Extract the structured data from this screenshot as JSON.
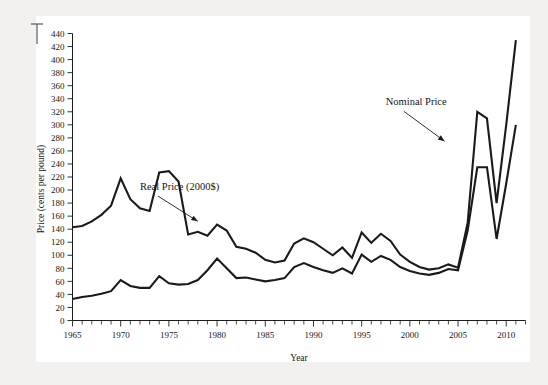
{
  "chart_data": {
    "type": "line",
    "title": "",
    "xlabel": "Year",
    "ylabel": "Price (cents per pound)",
    "xlim": [
      1965,
      2012
    ],
    "ylim": [
      0,
      440
    ],
    "grid": false,
    "legend_position": "inline-annotations",
    "x_tick_labels": [
      "1965",
      "1970",
      "1975",
      "1980",
      "1985",
      "1990",
      "1995",
      "2000",
      "2005",
      "2010"
    ],
    "x_tick_values": [
      1965,
      1970,
      1975,
      1980,
      1985,
      1990,
      1995,
      2000,
      2005,
      2010
    ],
    "x_minor_tick_step": 1,
    "y_tick_labels": [
      "0",
      "20",
      "40",
      "60",
      "80",
      "100",
      "120",
      "140",
      "160",
      "180",
      "200",
      "220",
      "240",
      "260",
      "280",
      "300",
      "320",
      "340",
      "360",
      "380",
      "400",
      "420",
      "440"
    ],
    "y_tick_values": [
      0,
      20,
      40,
      60,
      80,
      100,
      120,
      140,
      160,
      180,
      200,
      220,
      240,
      260,
      280,
      300,
      320,
      340,
      360,
      380,
      400,
      420,
      440
    ],
    "x": [
      1965,
      1966,
      1967,
      1968,
      1969,
      1970,
      1971,
      1972,
      1973,
      1974,
      1975,
      1976,
      1977,
      1978,
      1979,
      1980,
      1981,
      1982,
      1983,
      1984,
      1985,
      1986,
      1987,
      1988,
      1989,
      1990,
      1991,
      1992,
      1993,
      1994,
      1995,
      1996,
      1997,
      1998,
      1999,
      2000,
      2001,
      2002,
      2003,
      2004,
      2005,
      2006,
      2007,
      2008,
      2009,
      2010,
      2011
    ],
    "series": [
      {
        "name": "Real Price (2000$)",
        "units": "cents per pound",
        "values": [
          143,
          145,
          152,
          162,
          176,
          218,
          186,
          172,
          168,
          227,
          229,
          213,
          132,
          136,
          130,
          147,
          138,
          113,
          110,
          104,
          93,
          89,
          92,
          118,
          126,
          120,
          110,
          100,
          112,
          96,
          135,
          119,
          133,
          122,
          101,
          90,
          82,
          78,
          80,
          86,
          81,
          150,
          320,
          310,
          180,
          300,
          430
        ]
      },
      {
        "name": "Nominal Price",
        "units": "cents per pound",
        "values": [
          33,
          36,
          38,
          41,
          45,
          62,
          53,
          50,
          50,
          68,
          57,
          55,
          56,
          62,
          77,
          95,
          80,
          65,
          66,
          63,
          60,
          62,
          65,
          82,
          88,
          82,
          77,
          73,
          80,
          72,
          101,
          90,
          99,
          93,
          82,
          76,
          72,
          70,
          73,
          79,
          77,
          138,
          235,
          235,
          125,
          210,
          300
        ]
      }
    ],
    "annotations": [
      {
        "text": "Real Price (2000$)",
        "x_text": 1972.0,
        "y_text": 200,
        "arrow_to_x": 1978.0,
        "arrow_to_y": 152
      },
      {
        "text": "Nominal Price",
        "x_text": 1997.5,
        "y_text": 330,
        "arrow_to_x": 2003.6,
        "arrow_to_y": 275
      }
    ]
  },
  "figure": {
    "background_color": "#f2f1ef",
    "plot_background_color": "#ffffff",
    "line_color": "#1a1a1a"
  }
}
